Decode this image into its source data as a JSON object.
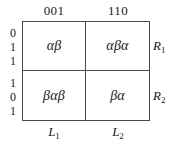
{
  "figure": {
    "type": "matrix-table",
    "column_headers": [
      "001",
      "110"
    ],
    "row_bit_labels": [
      {
        "bits": [
          "0",
          "1",
          "1"
        ]
      },
      {
        "bits": [
          "1",
          "0",
          "1"
        ]
      }
    ],
    "cells": [
      [
        "αβ",
        "αβα"
      ],
      [
        "βαβ",
        "βα"
      ]
    ],
    "row_labels": [
      {
        "base": "R",
        "sub": "1"
      },
      {
        "base": "R",
        "sub": "2"
      }
    ],
    "column_labels": [
      {
        "base": "L",
        "sub": "1"
      },
      {
        "base": "L",
        "sub": "2"
      }
    ],
    "colors": {
      "border": "#4a4a4a",
      "text": "#1a1a1a",
      "background": "#ffffff"
    }
  }
}
